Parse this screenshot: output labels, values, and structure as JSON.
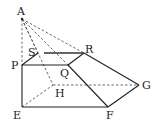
{
  "figure": {
    "type": "geometric-solid",
    "colors": {
      "line": "#222222",
      "background": "#ffffff"
    }
  },
  "points": {
    "A": {
      "label": "A",
      "x": 22,
      "y": 19
    },
    "S": {
      "label": "S",
      "x": 38,
      "y": 53
    },
    "R": {
      "label": "R",
      "x": 84,
      "y": 53
    },
    "P": {
      "label": "P",
      "x": 22,
      "y": 65
    },
    "Q": {
      "label": "Q",
      "x": 68,
      "y": 65
    },
    "H": {
      "label": "H",
      "x": 53,
      "y": 85
    },
    "G": {
      "label": "G",
      "x": 139,
      "y": 85
    },
    "E": {
      "label": "E",
      "x": 22,
      "y": 107
    },
    "F": {
      "label": "F",
      "x": 108,
      "y": 107
    }
  },
  "edges": {
    "solid": [
      "P-Q",
      "Q-R",
      "P-S",
      "S-R",
      "P-E",
      "E-F",
      "F-G",
      "G-R",
      "Q-F"
    ],
    "dashed": [
      "A-P",
      "A-S",
      "A-H",
      "A-R",
      "A-Q",
      "E-H",
      "H-G",
      "S-H"
    ]
  }
}
